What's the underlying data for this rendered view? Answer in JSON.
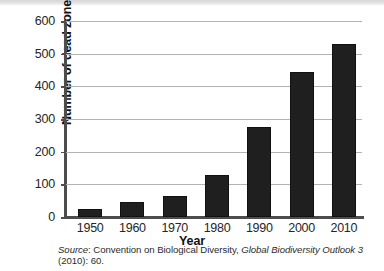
{
  "figure": {
    "source_note": {
      "label": "Source",
      "separator": ": ",
      "publisher": "Convention on Biological Diversity, ",
      "title": "Global Biodiversity Outlook 3",
      "citation": " (2010): 60."
    }
  },
  "chart_data": {
    "type": "bar",
    "title": "",
    "xlabel": "Year",
    "ylabel": "Number of dead zones",
    "categories": [
      "1950",
      "1960",
      "1970",
      "1980",
      "1990",
      "2000",
      "2010"
    ],
    "values": [
      25,
      45,
      65,
      130,
      275,
      445,
      530
    ],
    "ylim": [
      0,
      600
    ],
    "yticks": [
      0,
      100,
      200,
      300,
      400,
      500,
      600
    ],
    "ytick_labels": [
      "0",
      "100",
      "200",
      "300",
      "400",
      "500",
      "600"
    ],
    "grid": true,
    "grid_axis": "y",
    "legend": false,
    "bar_color": "#1f1f1f",
    "grid_color": "#b3b3b3",
    "axis_color": "#4d4d4d"
  }
}
